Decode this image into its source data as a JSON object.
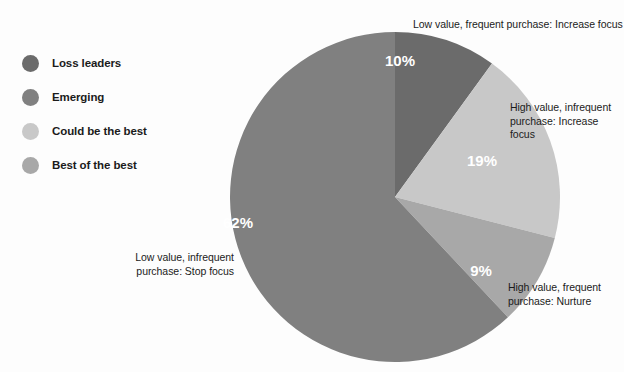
{
  "background_color": "#fdfdfd",
  "legend": {
    "items": [
      {
        "label": "Loss leaders",
        "color": "#6b6b6b",
        "swatch_name": "legend-swatch-loss-leaders"
      },
      {
        "label": "Emerging",
        "color": "#808080",
        "swatch_name": "legend-swatch-emerging"
      },
      {
        "label": "Could be the best",
        "color": "#c8c8c8",
        "swatch_name": "legend-swatch-could-be-the-best"
      },
      {
        "label": "Best of the best",
        "color": "#a8a8a8",
        "swatch_name": "legend-swatch-best-of-the-best"
      }
    ]
  },
  "annotations": {
    "top": "Low value, frequent purchase: Increase focus",
    "right": "High value, infrequent\npurchase: Increase focus",
    "bottom_right": "High value, frequent\npurchase: Nurture",
    "bottom_left": "Low value, infrequent\npurchase: Stop focus"
  },
  "chart_data": {
    "type": "pie",
    "title": "",
    "subtitle": "",
    "xlabel": "",
    "ylabel": "",
    "legend_position": "left",
    "start_angle_deg": 0,
    "direction": "clockwise",
    "center": {
      "x": 395,
      "y": 197
    },
    "radius": 165,
    "categories": [
      "Loss leaders",
      "Best of the best",
      "Emerging",
      "Could be the best"
    ],
    "slices": [
      {
        "name": "Loss leaders",
        "value": 10,
        "label": "10%",
        "color": "#6b6b6b",
        "annotation": "Low value, frequent purchase: Increase focus",
        "label_x": 400,
        "label_y": 62
      },
      {
        "name": "Could be the best",
        "value": 19,
        "label": "19%",
        "color": "#c8c8c8",
        "annotation": "High value, infrequent purchase: Increase focus",
        "label_x": 482,
        "label_y": 162
      },
      {
        "name": "Best of the best",
        "value": 9,
        "label": "9%",
        "color": "#a8a8a8",
        "annotation": "High value, frequent purchase: Nurture",
        "label_x": 481,
        "label_y": 272
      },
      {
        "name": "Emerging",
        "value": 62,
        "label": "62%",
        "color": "#808080",
        "annotation": "Low value, infrequent purchase: Stop focus",
        "label_x": 238,
        "label_y": 224
      }
    ],
    "values": [
      10,
      19,
      9,
      62
    ],
    "labels": [
      "10%",
      "19%",
      "9%",
      "62%"
    ],
    "total": 100,
    "units": "percent"
  }
}
